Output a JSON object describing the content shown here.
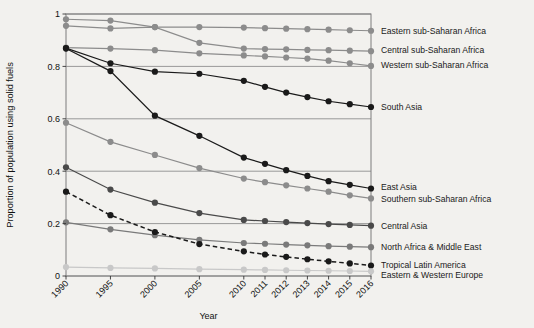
{
  "chart_data": {
    "type": "line",
    "title": "",
    "xlabel": "Year",
    "ylabel": "Proportion of population using solid fuels",
    "grid": true,
    "legend_position": "right-inline-labels",
    "categories": [
      "1990",
      "1995",
      "2000",
      "2005",
      "2010",
      "2011",
      "2012",
      "2013",
      "2014",
      "2015",
      "2016"
    ],
    "x": [
      1990,
      1995,
      2000,
      2005,
      2010,
      2011,
      2012,
      2013,
      2014,
      2015,
      2016
    ],
    "xtick_labels": [
      "1990",
      "1995",
      "2000",
      "2005",
      "2010",
      "2011",
      "2012",
      "2013",
      "2014",
      "2015",
      "2016"
    ],
    "ytick_labels": [
      "0",
      "0.2",
      "0.4",
      "0.6",
      "0.8",
      "1"
    ],
    "ytick_values": [
      0,
      0.2,
      0.4,
      0.6,
      0.8,
      1
    ],
    "ylim": [
      0,
      1
    ],
    "series": [
      {
        "name": "Eastern sub-Saharan Africa",
        "color": "#8c8c8c",
        "style": "solid",
        "values": [
          0.98,
          0.975,
          0.95,
          0.95,
          0.948,
          0.946,
          0.944,
          0.942,
          0.94,
          0.938,
          0.936
        ]
      },
      {
        "name": "Central sub-Saharan Africa",
        "color": "#8c8c8c",
        "style": "solid",
        "values": [
          0.955,
          0.945,
          0.95,
          0.89,
          0.868,
          0.866,
          0.865,
          0.863,
          0.862,
          0.86,
          0.858
        ]
      },
      {
        "name": "Western sub-Saharan Africa",
        "color": "#8c8c8c",
        "style": "solid",
        "values": [
          0.872,
          0.868,
          0.862,
          0.85,
          0.842,
          0.838,
          0.834,
          0.83,
          0.822,
          0.812,
          0.802
        ]
      },
      {
        "name": "South Asia",
        "color": "#1a1a1a",
        "style": "solid",
        "values": [
          0.87,
          0.812,
          0.78,
          0.772,
          0.745,
          0.722,
          0.7,
          0.683,
          0.667,
          0.656,
          0.645
        ]
      },
      {
        "name": "East Asia",
        "color": "#1a1a1a",
        "style": "solid",
        "values": [
          0.868,
          0.782,
          0.612,
          0.535,
          0.452,
          0.428,
          0.404,
          0.382,
          0.362,
          0.348,
          0.334
        ]
      },
      {
        "name": "Southern sub-Saharan Africa",
        "color": "#8c8c8c",
        "style": "solid",
        "values": [
          0.585,
          0.512,
          0.462,
          0.412,
          0.372,
          0.358,
          0.346,
          0.334,
          0.322,
          0.308,
          0.296
        ]
      },
      {
        "name": "Central Asia",
        "color": "#4a4a4a",
        "style": "solid",
        "values": [
          0.415,
          0.33,
          0.28,
          0.24,
          0.214,
          0.21,
          0.206,
          0.202,
          0.198,
          0.195,
          0.192
        ]
      },
      {
        "name": "North Africa & Middle East",
        "color": "#7a7a7a",
        "style": "solid",
        "values": [
          0.205,
          0.178,
          0.156,
          0.138,
          0.126,
          0.123,
          0.12,
          0.117,
          0.114,
          0.112,
          0.11
        ]
      },
      {
        "name": "Tropical Latin America",
        "color": "#1a1a1a",
        "style": "dashed",
        "values": [
          0.322,
          0.232,
          0.168,
          0.122,
          0.094,
          0.082,
          0.073,
          0.064,
          0.056,
          0.048,
          0.04
        ]
      },
      {
        "name": "Eastern & Western Europe",
        "color": "#c8c8c8",
        "style": "solid",
        "values": [
          0.034,
          0.031,
          0.029,
          0.026,
          0.024,
          0.023,
          0.022,
          0.021,
          0.02,
          0.019,
          0.018
        ]
      }
    ],
    "right_labels": [
      {
        "text": "Eastern sub-Saharan Africa",
        "y_value": 0.936
      },
      {
        "text": "Central sub-Saharan Africa",
        "y_value": 0.862
      },
      {
        "text": "Western sub-Saharan Africa",
        "y_value": 0.808
      },
      {
        "text": "South Asia",
        "y_value": 0.645
      },
      {
        "text": "East Asia",
        "y_value": 0.34
      },
      {
        "text": "Southern sub-Saharan Africa",
        "y_value": 0.296
      },
      {
        "text": "Central Asia",
        "y_value": 0.192
      },
      {
        "text": "North Africa & Middle East",
        "y_value": 0.112
      },
      {
        "text": "Tropical Latin America",
        "y_value": 0.044
      },
      {
        "text": "Eastern & Western Europe",
        "y_value": 0.006
      }
    ]
  }
}
